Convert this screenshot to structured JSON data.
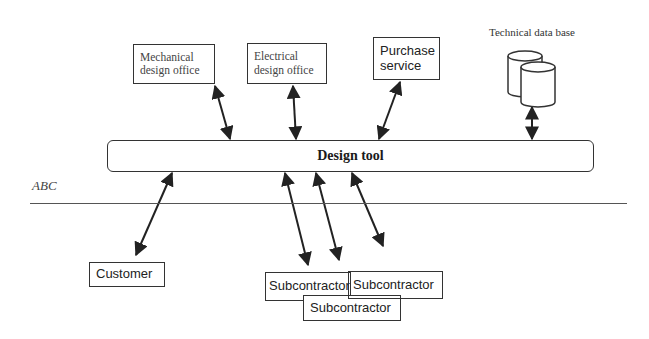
{
  "diagram": {
    "central_node": {
      "label": "Design tool"
    },
    "boundary": {
      "label": "ABC"
    },
    "top_nodes": [
      {
        "id": "mechanical",
        "label_line1": "Mechanical",
        "label_line2": "design office"
      },
      {
        "id": "electrical",
        "label_line1": "Electrical",
        "label_line2": "design office"
      },
      {
        "id": "purchase",
        "label_line1": "Purchase",
        "label_line2": "service"
      },
      {
        "id": "database",
        "label": "Technical data base",
        "icon": "database-cylinders-icon"
      }
    ],
    "bottom_nodes": [
      {
        "id": "customer",
        "label": "Customer"
      },
      {
        "id": "subcontractor_1",
        "label": "Subcontractor"
      },
      {
        "id": "subcontractor_2",
        "label": "Subcontractor"
      },
      {
        "id": "subcontractor_3",
        "label": "Subcontractor"
      }
    ],
    "edges": [
      {
        "from": "mechanical",
        "to": "Design tool",
        "type": "bidirectional"
      },
      {
        "from": "electrical",
        "to": "Design tool",
        "type": "bidirectional"
      },
      {
        "from": "purchase",
        "to": "Design tool",
        "type": "bidirectional"
      },
      {
        "from": "database",
        "to": "Design tool",
        "type": "bidirectional"
      },
      {
        "from": "customer",
        "to": "Design tool",
        "type": "bidirectional"
      },
      {
        "from": "subcontractor_1",
        "to": "Design tool",
        "type": "bidirectional"
      },
      {
        "from": "subcontractor_2",
        "to": "Design tool",
        "type": "bidirectional"
      },
      {
        "from": "subcontractor_3",
        "to": "Design tool",
        "type": "bidirectional"
      }
    ],
    "colors": {
      "stroke": "#333333",
      "background": "#ffffff"
    }
  }
}
